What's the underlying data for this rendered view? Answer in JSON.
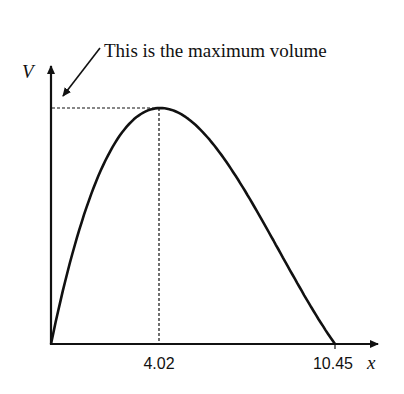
{
  "chart_data": {
    "type": "line",
    "title": "",
    "xlabel": "x",
    "ylabel": "V",
    "x_ticks": [
      "4.02",
      "10.45"
    ],
    "x_tick_values": [
      4.02,
      10.45
    ],
    "xlim": [
      0,
      10.45
    ],
    "grid": false,
    "legend": null,
    "series": [
      {
        "name": "V",
        "description": "Cubic volume curve, zero at x=0 and x=10.45, maximum at x=4.02",
        "x": [
          0,
          1,
          2,
          3,
          4.02,
          5,
          6,
          7,
          8,
          9,
          10.45
        ],
        "relative_y": [
          0,
          0.51,
          0.85,
          1.0,
          1.0,
          0.94,
          0.81,
          0.63,
          0.43,
          0.24,
          0
        ]
      }
    ],
    "annotations": [
      {
        "text": "This is the maximum volume",
        "points_to": "maximum of V on the V-axis (dashed guide)"
      }
    ],
    "guides": [
      {
        "type": "dashed-horizontal",
        "from": "V-axis",
        "to": "maximum"
      },
      {
        "type": "dashed-vertical",
        "from": "maximum",
        "to": "x=4.02"
      }
    ]
  },
  "labels": {
    "annotation": "This is the maximum volume",
    "y_axis": "V",
    "x_axis": "x",
    "tick_max": "4.02",
    "tick_root": "10.45"
  }
}
